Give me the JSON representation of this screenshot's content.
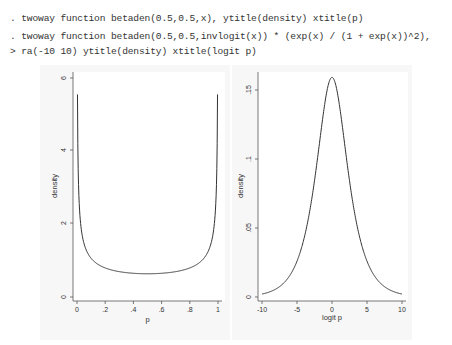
{
  "commands": [
    ". twoway function betaden(0.5,0.5,x), ytitle(density) xtitle(p)",
    ". twoway function betaden(0.5,0.5,invlogit(x)) * (exp(x) / (1 + exp(x))^2),",
    "> ra(-10 10) ytitle(density) xtitle(logit p)"
  ],
  "chart_data": [
    {
      "type": "line",
      "title": "",
      "function": "betaden(0.5,0.5,x)",
      "xlabel": "p",
      "ylabel": "density",
      "xlim": [
        0,
        1
      ],
      "ylim": [
        0,
        6
      ],
      "x_ticks": [
        "0",
        ".2",
        ".4",
        ".6",
        ".8",
        "1"
      ],
      "y_ticks": [
        "0",
        "2",
        "4",
        "6"
      ],
      "x": [
        0.005,
        0.01,
        0.02,
        0.05,
        0.1,
        0.2,
        0.3,
        0.4,
        0.5,
        0.6,
        0.7,
        0.8,
        0.9,
        0.95,
        0.98,
        0.99,
        0.995
      ],
      "values": [
        4.52,
        3.2,
        2.27,
        1.46,
        1.06,
        0.8,
        0.69,
        0.65,
        0.64,
        0.65,
        0.69,
        0.8,
        1.06,
        1.46,
        2.27,
        3.2,
        4.52
      ],
      "grid": false,
      "legend": null
    },
    {
      "type": "line",
      "title": "",
      "function": "betaden(0.5,0.5,invlogit(x)) * (exp(x)/(1+exp(x))^2)",
      "xlabel": "logit p",
      "ylabel": "density",
      "xlim": [
        -10,
        10
      ],
      "ylim": [
        0,
        0.16
      ],
      "x_ticks": [
        "-10",
        "-5",
        "0",
        "5",
        "10"
      ],
      "y_ticks": [
        "0",
        ".05",
        ".1",
        ".15"
      ],
      "x": [
        -10,
        -8,
        -6,
        -4,
        -3,
        -2,
        -1,
        0,
        1,
        2,
        3,
        4,
        6,
        8,
        10
      ],
      "values": [
        0.0021,
        0.0058,
        0.0158,
        0.0427,
        0.0696,
        0.1084,
        0.1447,
        0.1592,
        0.1447,
        0.1084,
        0.0696,
        0.0427,
        0.0158,
        0.0058,
        0.0021
      ],
      "grid": false,
      "legend": null
    }
  ],
  "left_chart": {
    "ylabel": "density",
    "xlabel": "p",
    "y_ticks": [
      "0",
      "2",
      "4",
      "6"
    ],
    "x_ticks": [
      "0",
      ".2",
      ".4",
      ".6",
      ".8",
      "1"
    ]
  },
  "right_chart": {
    "ylabel": "density",
    "xlabel": "logit p",
    "y_ticks": [
      "0",
      ".05",
      ".1",
      ".15"
    ],
    "x_ticks": [
      "-10",
      "-5",
      "0",
      "5",
      "10"
    ]
  }
}
